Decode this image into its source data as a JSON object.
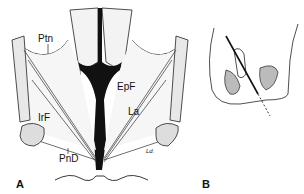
{
  "figure": {
    "panel_a": {
      "letter": "A",
      "labels": {
        "ptn": "Ptn",
        "epf": "EpF",
        "la": "La",
        "irf": "IrF",
        "pnd": "PnD"
      },
      "signature": "Ld."
    },
    "panel_b": {
      "letter": "B"
    }
  }
}
